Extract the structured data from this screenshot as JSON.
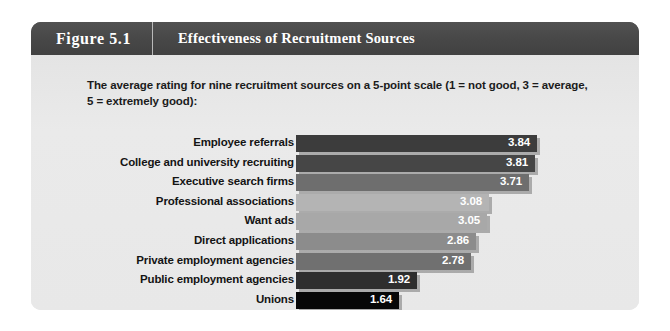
{
  "figure": {
    "number": "Figure 5.1",
    "title": "Effectiveness of Recruitment Sources",
    "description": "The average rating for nine recruitment sources on a 5-point scale (1 = not good, 3 = average, 5 = extremely good):"
  },
  "colors": {
    "header_background": "#4a4a4a",
    "body_background": "#e8e8e8",
    "header_text": "#ffffff",
    "label_text": "#141414",
    "value_text": "#ffffff",
    "bar_shadow": "#969696"
  },
  "chart_data": {
    "type": "bar",
    "orientation": "horizontal",
    "title": "Effectiveness of Recruitment Sources",
    "xlabel": "",
    "ylabel": "",
    "scale_note": "5-point scale (1 = not good, 3 = average, 5 = extremely good)",
    "xlim": [
      0,
      5
    ],
    "grid": false,
    "legend": "none",
    "categories": [
      "Employee referrals",
      "College and university recruiting",
      "Executive search firms",
      "Professional associations",
      "Want ads",
      "Direct applications",
      "Private employment agencies",
      "Public employment agencies",
      "Unions"
    ],
    "values": [
      3.84,
      3.81,
      3.71,
      3.08,
      3.05,
      2.86,
      2.78,
      1.92,
      1.64
    ],
    "value_labels": [
      "3.84",
      "3.81",
      "3.71",
      "3.08",
      "3.05",
      "2.86",
      "2.78",
      "1.92",
      "1.64"
    ],
    "bar_colors": [
      "#3c3c3c",
      "#464646",
      "#6e6e6e",
      "#b4b4b4",
      "#a8a8a8",
      "#8c8c8c",
      "#707070",
      "#2e2e2e",
      "#070707"
    ],
    "bars": [
      {
        "label": "Employee referrals",
        "value": 3.84,
        "value_label": "3.84",
        "color": "#3c3c3c",
        "width_px": 241
      },
      {
        "label": "College and university recruiting",
        "value": 3.81,
        "value_label": "3.81",
        "color": "#464646",
        "width_px": 239
      },
      {
        "label": "Executive search firms",
        "value": 3.71,
        "value_label": "3.71",
        "color": "#6e6e6e",
        "width_px": 233
      },
      {
        "label": "Professional associations",
        "value": 3.08,
        "value_label": "3.08",
        "color": "#b4b4b4",
        "width_px": 193
      },
      {
        "label": "Want ads",
        "value": 3.05,
        "value_label": "3.05",
        "color": "#a8a8a8",
        "width_px": 191
      },
      {
        "label": "Direct applications",
        "value": 2.86,
        "value_label": "2.86",
        "color": "#8c8c8c",
        "width_px": 180
      },
      {
        "label": "Private employment agencies",
        "value": 2.78,
        "value_label": "2.78",
        "color": "#707070",
        "width_px": 175
      },
      {
        "label": "Public employment agencies",
        "value": 1.92,
        "value_label": "1.92",
        "color": "#2e2e2e",
        "width_px": 121
      },
      {
        "label": "Unions",
        "value": 1.64,
        "value_label": "1.64",
        "color": "#070707",
        "width_px": 103
      }
    ]
  }
}
